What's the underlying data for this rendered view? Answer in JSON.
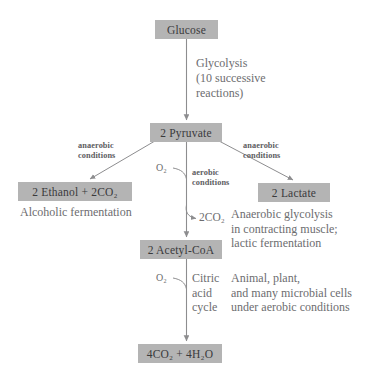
{
  "diagram": {
    "box_color": "#b4b4b4",
    "line_color": "#8d8d8f",
    "text_color": "#6a6a6c",
    "boxes": {
      "glucose": "Glucose",
      "pyruvate": "2 Pyruvate",
      "ethanol": "2 Ethanol + 2CO₂",
      "lactate": "2 Lactate",
      "acetyl_coa": "2 Acetyl-CoA",
      "final": "4CO₂ + 4H₂O"
    },
    "labels": {
      "glycolysis_line1": "Glycolysis",
      "glycolysis_line2": "(10 successive",
      "glycolysis_line3": "reactions)",
      "anaerobic_left_line1": "anaerobic",
      "anaerobic_left_line2": "conditions",
      "anaerobic_right_line1": "anaerobic",
      "anaerobic_right_line2": "conditions",
      "aerobic_line1": "aerobic",
      "aerobic_line2": "conditions",
      "oxygen_upper": "O₂",
      "oxygen_lower": "O₂",
      "co2_release": "2CO₂",
      "citric_line1": "Citric",
      "citric_line2": "acid",
      "citric_line3": "cycle",
      "alcoholic_fermentation": "Alcoholic fermentation",
      "anaerobic_gly_line1": "Anaerobic glycolysis",
      "anaerobic_gly_line2": "in contracting muscle;",
      "anaerobic_gly_line3": "lactic fermentation",
      "aerobic_cells_line1": "Animal, plant,",
      "aerobic_cells_line2": "and many microbial cells",
      "aerobic_cells_line3": "under aerobic conditions"
    }
  }
}
